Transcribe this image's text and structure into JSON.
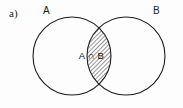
{
  "figure": {
    "item_label": "a)",
    "background_color": "#fdfdfd",
    "stroke_color": "#1c1c1c",
    "hatch_color": "#2b2b2b"
  },
  "diagram": {
    "type": "venn-two-set",
    "sets": [
      {
        "name": "A",
        "label": "A",
        "label_position": "top-left",
        "center_x": 72,
        "center_y": 56,
        "radius": 39
      },
      {
        "name": "B",
        "label": "B",
        "label_position": "top-right",
        "center_x": 126,
        "center_y": 56,
        "radius": 39
      }
    ],
    "shaded_region": {
      "label": "A ∩ B",
      "operation": "intersection",
      "fill": "diagonal-hatch",
      "hatch_angle_degrees": 45,
      "hatch_spacing_px": 2
    }
  }
}
